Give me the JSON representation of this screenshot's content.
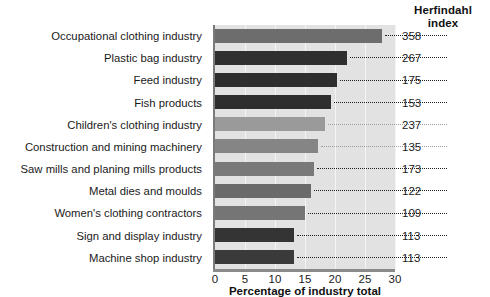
{
  "header": {
    "herfindahl_line1": "Herfindahl",
    "herfindahl_line2": "index"
  },
  "axis": {
    "xlabel": "Percentage of industry total",
    "ticks": [
      "0",
      "5",
      "10",
      "15",
      "20",
      "25",
      "30"
    ]
  },
  "chart_data": {
    "type": "bar",
    "orientation": "horizontal",
    "title": "",
    "xlabel": "Percentage of industry total",
    "ylabel": "",
    "xlim": [
      0,
      30
    ],
    "grid": true,
    "legend": null,
    "value_axis_label": "Herfindahl index",
    "categories": [
      "Occupational clothing industry",
      "Plastic bag industry",
      "Feed industry",
      "Fish products",
      "Children's clothing industry",
      "Construction and mining machinery",
      "Saw mills and planing mills products",
      "Metal dies and moulds",
      "Women's clothing contractors",
      "Sign and display industry",
      "Machine shop industry"
    ],
    "values": [
      27.8,
      22.0,
      20.4,
      19.3,
      18.3,
      17.2,
      16.5,
      16.0,
      15.0,
      13.2,
      13.2
    ],
    "annotations": [
      {
        "label": "Occupational clothing industry",
        "herfindahl_index": 358
      },
      {
        "label": "Plastic bag industry",
        "herfindahl_index": 267
      },
      {
        "label": "Feed industry",
        "herfindahl_index": 175
      },
      {
        "label": "Fish products",
        "herfindahl_index": 153
      },
      {
        "label": "Children's clothing industry",
        "herfindahl_index": 237
      },
      {
        "label": "Construction and mining machinery",
        "herfindahl_index": 135
      },
      {
        "label": "Saw mills and planing mills products",
        "herfindahl_index": 173
      },
      {
        "label": "Metal dies and moulds",
        "herfindahl_index": 122
      },
      {
        "label": "Women's clothing contractors",
        "herfindahl_index": 109
      },
      {
        "label": "Sign and display industry",
        "herfindahl_index": 113
      },
      {
        "label": "Machine shop industry",
        "herfindahl_index": 113
      }
    ],
    "bar_colors": [
      "#6d6d6d",
      "#2f2f2f",
      "#2e2e2e",
      "#2e2e2e",
      "#9a9a9a",
      "#858585",
      "#797979",
      "#6a6a6a",
      "#757575",
      "#343434",
      "#3a3a3a"
    ]
  },
  "rows": [
    {
      "label": "Occupational clothing industry",
      "value": 27.8,
      "index": "358",
      "color": "#6d6d6d"
    },
    {
      "label": "Plastic bag industry",
      "value": 22.0,
      "index": "267",
      "color": "#2f2f2f"
    },
    {
      "label": "Feed industry",
      "value": 20.4,
      "index": "175",
      "color": "#2e2e2e"
    },
    {
      "label": "Fish products",
      "value": 19.3,
      "index": "153",
      "color": "#2e2e2e"
    },
    {
      "label": "Children's clothing industry",
      "value": 18.3,
      "index": "237",
      "color": "#9a9a9a"
    },
    {
      "label": "Construction and mining machinery",
      "value": 17.2,
      "index": "135",
      "color": "#858585"
    },
    {
      "label": "Saw mills and planing mills products",
      "value": 16.5,
      "index": "173",
      "color": "#797979"
    },
    {
      "label": "Metal dies and moulds",
      "value": 16.0,
      "index": "122",
      "color": "#6a6a6a"
    },
    {
      "label": "Women's clothing contractors",
      "value": 15.0,
      "index": "109",
      "color": "#757575"
    },
    {
      "label": "Sign and display industry",
      "value": 13.2,
      "index": "113",
      "color": "#343434"
    },
    {
      "label": "Machine shop industry",
      "value": 13.2,
      "index": "113",
      "color": "#3a3a3a"
    }
  ]
}
